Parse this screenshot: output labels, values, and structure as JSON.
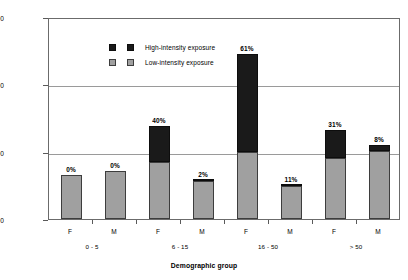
{
  "chart_data": {
    "type": "bar",
    "title": "",
    "xlabel": "Demographic group",
    "ylabel": "PM10 exposure concentration (μg / m3)",
    "ylabel_base": "PM",
    "ylabel_sub": "10",
    "ylabel_mid": " exposure concentration (μ g / m",
    "ylabel_sup": "3",
    "ylabel_end": " )",
    "ylim": [
      0,
      6000
    ],
    "yticks": [
      0,
      2000,
      4000,
      6000
    ],
    "ytick_labels": [
      "0",
      "2000",
      "4000",
      "6000"
    ],
    "grid": true,
    "grid_axis": "y",
    "stacked": true,
    "legend_position": "top-left",
    "categories": [
      "F",
      "M",
      "F",
      "M",
      "F",
      "M",
      "F",
      "M"
    ],
    "groups": [
      {
        "label": "0 - 5",
        "categories": [
          "F",
          "M"
        ]
      },
      {
        "label": "6 - 15",
        "categories": [
          "F",
          "M"
        ]
      },
      {
        "label": "16 - 50",
        "categories": [
          "F",
          "M"
        ]
      },
      {
        "label": "> 50",
        "categories": [
          "F",
          "M"
        ]
      }
    ],
    "series": [
      {
        "name": "Low-intensity exposure",
        "color": "#a0a0a0",
        "values": [
          1320,
          1420,
          1700,
          1120,
          2000,
          980,
          1820,
          2030
        ]
      },
      {
        "name": "High-intensity exposure",
        "color": "#1a1a1a",
        "values": [
          0,
          0,
          1050,
          30,
          2900,
          40,
          830,
          170
        ]
      }
    ],
    "totals": [
      1320,
      1420,
      2750,
      1150,
      4900,
      1020,
      2650,
      2200
    ],
    "annotations": [
      "0%",
      "0%",
      "40%",
      "2%",
      "61%",
      "11%",
      "31%",
      "8%"
    ]
  },
  "legend": {
    "items": [
      {
        "name": "high-intensity",
        "label": "High-intensity exposure"
      },
      {
        "name": "low-intensity",
        "label": "Low-intensity exposure"
      }
    ]
  }
}
